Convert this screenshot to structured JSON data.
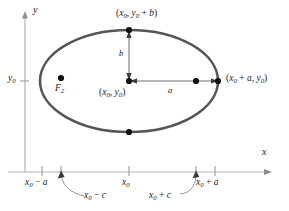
{
  "figure": {
    "type": "ellipse-geometry-diagram",
    "axes": {
      "x_label": "x",
      "y_label": "y"
    },
    "labels": {
      "top_vertex": "(x0, y0 + b)",
      "center": "(x0, y0)",
      "right_vertex": "(x0 + a, y0)",
      "focus_left": "F2",
      "y_tick": "y0",
      "x_tick_left_vertex": "x0 - a",
      "x_tick_center": "x0",
      "x_tick_right_vertex": "x0 + a",
      "leader_left_focus": "x0 - c",
      "leader_right_focus": "x0 + c",
      "semi_minor": "b",
      "semi_major": "a"
    },
    "parts": {
      "x0": "x",
      "zero": "0",
      "y0": "y",
      "plus": "+",
      "minus": "−",
      "a": "a",
      "b": "b",
      "c": "c",
      "comma": ",",
      "lparen": "(",
      "rparen": ")",
      "F": "F",
      "two": "2"
    },
    "colors": {
      "ellipse_stroke": "#555555",
      "axis": "#b0b0b0",
      "arrow": "#6e6e6e",
      "point": "#111111",
      "text": "#1a1a1a",
      "leader": "#8a8a8a"
    },
    "geometry": {
      "center_x": 129,
      "center_y": 81,
      "semi_major_px": 89,
      "semi_minor_px": 51,
      "focus_left_x": 61,
      "focus_right_x": 196,
      "x_axis_y": 172,
      "y_axis_x": 25
    }
  }
}
